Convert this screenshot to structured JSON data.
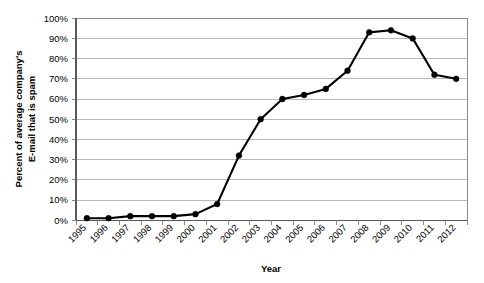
{
  "chart_data": {
    "type": "line",
    "title": "",
    "xlabel": "Year",
    "ylabel": "Percent of average company's E-mail that is spam",
    "ylabel_line1": "Percent of average company's",
    "ylabel_line2": "E-mail that is spam",
    "categories": [
      "1995",
      "1996",
      "1997",
      "1998",
      "1999",
      "2000",
      "2001",
      "2002",
      "2003",
      "2004",
      "2005",
      "2006",
      "2007",
      "2008",
      "2009",
      "2010",
      "2011",
      "2012"
    ],
    "values": [
      1,
      1,
      2,
      2,
      2,
      3,
      8,
      32,
      50,
      60,
      62,
      65,
      74,
      93,
      94,
      90,
      72,
      70
    ],
    "series": [
      {
        "name": "Percent of average company's E-mail that is spam",
        "values": [
          1,
          1,
          2,
          2,
          2,
          3,
          8,
          32,
          50,
          60,
          62,
          65,
          74,
          93,
          94,
          90,
          72,
          70
        ]
      }
    ],
    "ylim": [
      0,
      100
    ],
    "ytick_values": [
      0,
      10,
      20,
      30,
      40,
      50,
      60,
      70,
      80,
      90,
      100
    ],
    "ytick_labels": [
      "0%",
      "10%",
      "20%",
      "30%",
      "40%",
      "50%",
      "60%",
      "70%",
      "80%",
      "90%",
      "100%"
    ],
    "grid": true,
    "grid_axis": "y",
    "legend": false,
    "legend_position": "none",
    "marker": "circle",
    "line_color": "#000000",
    "grid_color": "#9a9a9a",
    "background_color": "#ffffff",
    "xtick_rotation": -45
  }
}
